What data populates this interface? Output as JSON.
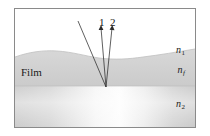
{
  "figure": {
    "border_color": "#8a8a8a",
    "background_color": "#ffffff"
  },
  "labels": {
    "ray1": "1",
    "ray2": "2",
    "film": "Film",
    "n1_base": "n",
    "n1_sub": "1",
    "nf_base": "n",
    "nf_sub": "f",
    "n2_base": "n",
    "n2_sub": "2"
  },
  "layers": [
    {
      "name": "ambient-layer",
      "label": "n1",
      "description": "Upper medium above the film, white",
      "color": "#ffffff",
      "top": 0,
      "bottom": 46
    },
    {
      "name": "film-layer",
      "label": "nf",
      "description": "Thin film with wavy upper surface",
      "color": "#d2d2d2",
      "top": 46,
      "bottom": 78
    },
    {
      "name": "substrate-layer",
      "label": "n2",
      "description": "Substrate below the film with light gradient",
      "color": "#cfcfcf",
      "gradient_highlight": "#fdfdfd",
      "top": 78,
      "bottom": 120
    }
  ],
  "rays": [
    {
      "name": "incident-ray",
      "has_arrow": false,
      "from_x": 91,
      "from_y": 78,
      "to_x": 63,
      "to_y": 12
    },
    {
      "name": "reflected-ray-1",
      "label": "1",
      "has_arrow": true,
      "from_x": 91,
      "from_y": 78,
      "to_x": 86,
      "to_y": 17
    },
    {
      "name": "reflected-ray-2",
      "label": "2",
      "has_arrow": true,
      "from_x": 91,
      "from_y": 78,
      "to_x": 97,
      "to_y": 17
    }
  ],
  "colors": {
    "line": "#2b2b2b",
    "text": "#1a1a1a",
    "film_fill": "#d2d2d2",
    "substrate_fill": "#cfcfcf",
    "border": "#8a8a8a"
  }
}
